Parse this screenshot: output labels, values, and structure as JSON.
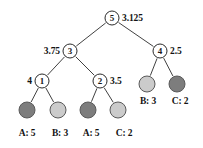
{
  "diagram": {
    "canvas": {
      "width": 203,
      "height": 148
    },
    "colors": {
      "background": "#ffffff",
      "stroke": "#2b2b2b",
      "text": "#131313",
      "leaf_dark": "#7d7d7d",
      "leaf_light": "#cbcbcb"
    },
    "nodes": [
      {
        "id": "root",
        "label": "5",
        "value": "3.125",
        "value_side": "right",
        "x": 112,
        "y": 18,
        "kind": "internal"
      },
      {
        "id": "n3",
        "label": "3",
        "value": "3.75",
        "value_side": "left",
        "x": 70,
        "y": 51,
        "kind": "internal"
      },
      {
        "id": "n4",
        "label": "4",
        "value": "2.5",
        "value_side": "right",
        "x": 160,
        "y": 51,
        "kind": "internal"
      },
      {
        "id": "n1",
        "label": "1",
        "value": "4",
        "value_side": "left",
        "x": 42,
        "y": 81,
        "kind": "internal"
      },
      {
        "id": "n2",
        "label": "2",
        "value": "3.5",
        "value_side": "right",
        "x": 100,
        "y": 81,
        "kind": "internal"
      }
    ],
    "leaves": [
      {
        "id": "l1",
        "label": "A: 5",
        "shade": "dark",
        "x": 27,
        "y": 110,
        "label_x": 27,
        "label_y": 133
      },
      {
        "id": "l2",
        "label": "B: 3",
        "shade": "light",
        "x": 58,
        "y": 110,
        "label_x": 60,
        "label_y": 133
      },
      {
        "id": "l3",
        "label": "A: 5",
        "shade": "dark",
        "x": 88,
        "y": 110,
        "label_x": 91,
        "label_y": 133
      },
      {
        "id": "l4",
        "label": "C: 2",
        "shade": "light",
        "x": 118,
        "y": 110,
        "label_x": 124,
        "label_y": 133
      },
      {
        "id": "l5",
        "label": "B: 3",
        "shade": "light",
        "x": 147,
        "y": 84,
        "label_x": 148,
        "label_y": 101
      },
      {
        "id": "l6",
        "label": "C: 2",
        "shade": "dark",
        "x": 177,
        "y": 84,
        "label_x": 180,
        "label_y": 101
      }
    ],
    "edges": [
      {
        "from": "root",
        "to": "n3"
      },
      {
        "from": "root",
        "to": "n4"
      },
      {
        "from": "n3",
        "to": "n1"
      },
      {
        "from": "n3",
        "to": "n2"
      },
      {
        "from": "n1",
        "to": "l1"
      },
      {
        "from": "n1",
        "to": "l2"
      },
      {
        "from": "n2",
        "to": "l3"
      },
      {
        "from": "n2",
        "to": "l4"
      },
      {
        "from": "n4",
        "to": "l5"
      },
      {
        "from": "n4",
        "to": "l6"
      }
    ]
  }
}
